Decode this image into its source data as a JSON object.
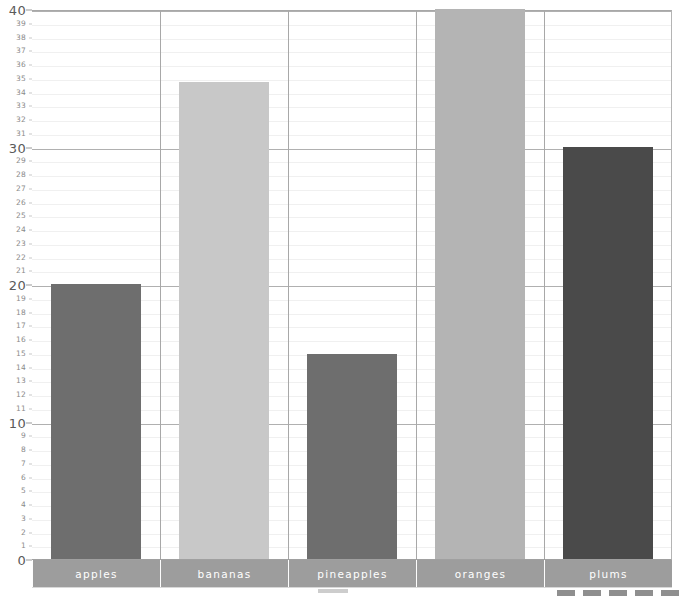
{
  "chart_data": {
    "type": "bar",
    "title": "",
    "subtitle": "",
    "xlabel": "",
    "ylabel": "",
    "categories": [
      "apples",
      "bananas",
      "pineapples",
      "oranges",
      "plums"
    ],
    "values": [
      20,
      34.7,
      14.9,
      40,
      30
    ],
    "series": [
      {
        "name": "fruit count",
        "values": [
          20,
          34.7,
          14.9,
          40,
          30
        ]
      }
    ],
    "bar_colors": [
      "#6e6e6e",
      "#c8c8c8",
      "#6e6e6e",
      "#b4b4b4",
      "#4a4a4a"
    ],
    "ylim": [
      0,
      40
    ],
    "y_major_ticks": [
      0,
      10,
      20,
      30,
      40
    ],
    "y_minor_ticks": [
      1,
      2,
      3,
      4,
      5,
      6,
      7,
      8,
      9,
      11,
      12,
      13,
      14,
      15,
      16,
      17,
      18,
      19,
      21,
      22,
      23,
      24,
      25,
      26,
      27,
      28,
      29,
      31,
      32,
      33,
      34,
      35,
      36,
      37,
      38,
      39
    ],
    "y_tick_labels": [
      "0",
      "1",
      "2",
      "3",
      "4",
      "5",
      "6",
      "7",
      "8",
      "9",
      "10",
      "11",
      "12",
      "13",
      "14",
      "15",
      "16",
      "17",
      "18",
      "19",
      "20",
      "21",
      "22",
      "23",
      "24",
      "25",
      "26",
      "27",
      "28",
      "29",
      "30",
      "31",
      "32",
      "33",
      "34",
      "35",
      "36",
      "37",
      "38",
      "39",
      "40"
    ],
    "grid": true,
    "grid_minor": true,
    "legend": false,
    "legend_position": "none",
    "annotations": [],
    "category_band_color": "#9d9d9d",
    "category_label_color": "#ffffff",
    "plot_background": "#ffffff",
    "gridline_minor_color": "#f0f0f0",
    "gridline_major_color": "#b0b0b0",
    "category_separator_color": "#a8a8a8"
  }
}
